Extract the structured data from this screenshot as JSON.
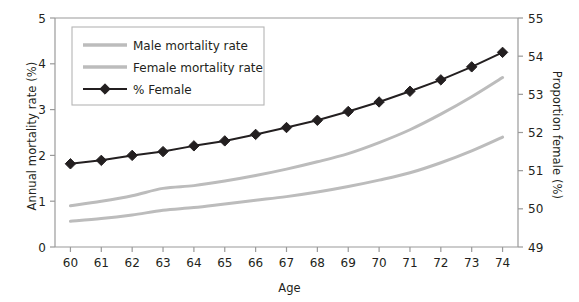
{
  "chart_data": {
    "type": "line",
    "title": "",
    "xlabel": "Age",
    "ylabel": "Annual mortality rate (%)",
    "ylabel_right": "Proportion female (%)",
    "x": [
      60,
      61,
      62,
      63,
      64,
      65,
      66,
      67,
      68,
      69,
      70,
      71,
      72,
      73,
      74
    ],
    "xlim": [
      59.5,
      74.5
    ],
    "ylim": [
      0,
      5
    ],
    "ylim_right": [
      49,
      55
    ],
    "yticks": [
      0,
      1,
      2,
      3,
      4,
      5
    ],
    "yticks_right": [
      49,
      50,
      51,
      52,
      53,
      54,
      55
    ],
    "xticks": [
      60,
      61,
      62,
      63,
      64,
      65,
      66,
      67,
      68,
      69,
      70,
      71,
      72,
      73,
      74
    ],
    "grid": false,
    "legend_position": "upper left inside",
    "series": [
      {
        "name": "Male mortality rate",
        "axis": "left",
        "color": "#bcbcbc",
        "marker": "none",
        "values": [
          0.9,
          1.0,
          1.12,
          1.28,
          1.34,
          1.44,
          1.56,
          1.7,
          1.86,
          2.04,
          2.28,
          2.56,
          2.9,
          3.28,
          3.7
        ]
      },
      {
        "name": "Female mortality rate",
        "axis": "left",
        "color": "#bcbcbc",
        "marker": "none",
        "values": [
          0.56,
          0.62,
          0.7,
          0.8,
          0.86,
          0.94,
          1.02,
          1.1,
          1.2,
          1.32,
          1.46,
          1.62,
          1.84,
          2.1,
          2.4
        ]
      },
      {
        "name": "% Female",
        "axis": "right",
        "color": "#231f20",
        "marker": "diamond",
        "values": [
          51.18,
          51.27,
          51.4,
          51.5,
          51.65,
          51.78,
          51.95,
          52.13,
          52.32,
          52.55,
          52.8,
          53.08,
          53.38,
          53.72,
          54.1
        ]
      }
    ]
  },
  "legend": {
    "items": [
      {
        "label": "Male mortality rate",
        "color": "#bcbcbc",
        "marker": "none"
      },
      {
        "label": "Female mortality rate",
        "color": "#bcbcbc",
        "marker": "none"
      },
      {
        "label": "% Female",
        "color": "#231f20",
        "marker": "diamond"
      }
    ]
  },
  "axes": {
    "left_title": "Annual mortality rate (%)",
    "right_title": "Proportion female (%)",
    "bottom_title": "Age"
  },
  "colors": {
    "axis": "#9a9a9a",
    "text": "#231f20",
    "gray_series": "#bcbcbc",
    "black_series": "#231f20",
    "background": "#ffffff"
  },
  "caption": {
    "text": ""
  }
}
